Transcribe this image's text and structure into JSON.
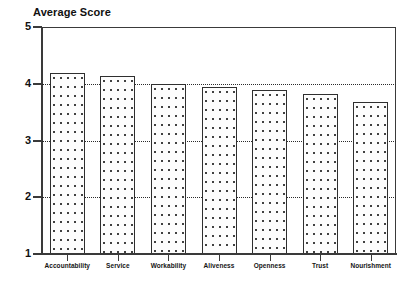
{
  "chart_data": {
    "type": "bar",
    "title": "Average Score",
    "xlabel": "",
    "ylabel": "",
    "categories": [
      "Accountability",
      "Service",
      "Workability",
      "Aliveness",
      "Openness",
      "Trust",
      "Nourishment"
    ],
    "values": [
      4.19,
      4.14,
      3.99,
      3.94,
      3.89,
      3.82,
      3.68
    ],
    "ylim": [
      1,
      5
    ],
    "yticks": [
      1,
      2,
      3,
      4,
      5
    ],
    "ytick_labels": [
      "1",
      "2",
      "3",
      "4",
      "5"
    ],
    "gridlines_at": [
      2,
      3,
      4
    ],
    "grid": true,
    "grid_style": "dotted",
    "legend": null,
    "legend_position": "none",
    "bar_fill": "white-with-dot-stipple",
    "bar_border_color": "#2f2f2f",
    "axis_color": "#3a3a3a",
    "text_color": "#111111",
    "background": "#ffffff"
  }
}
